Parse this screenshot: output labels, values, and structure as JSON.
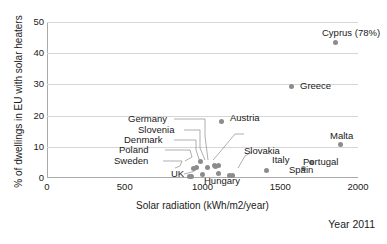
{
  "chart_data": {
    "type": "scatter",
    "title": "",
    "xlabel": "Solar radiation (kWh/m2/year)",
    "ylabel": "% of dwellings in EU with solar heaters",
    "xlim": [
      0,
      2000
    ],
    "ylim": [
      0,
      50
    ],
    "xticks": [
      "0",
      "500",
      "1000",
      "1500",
      "2000"
    ],
    "yticks": [
      "0",
      "10",
      "20",
      "30",
      "40",
      "50"
    ],
    "grid": "horizontal",
    "legend": "none",
    "annotation": "Year 2011",
    "marker_color": "#8c8c8c",
    "points": [
      {
        "name": "Cyprus",
        "label": "Cyprus (78%)",
        "x": 1855,
        "y": 43.5
      },
      {
        "name": "Greece",
        "label": "Greece",
        "x": 1575,
        "y": 29.2
      },
      {
        "name": "Austria",
        "label": "Austria",
        "x": 1125,
        "y": 18.2
      },
      {
        "name": "Malta",
        "label": "Malta",
        "x": 1885,
        "y": 10.8
      },
      {
        "name": "Germany",
        "label": "Germany",
        "x": 1075,
        "y": 4.0
      },
      {
        "name": "Slovenia",
        "label": "Slovenia",
        "x": 1085,
        "y": 3.6
      },
      {
        "name": "France",
        "label": "France",
        "x": 1105,
        "y": 3.9
      },
      {
        "name": "Denmark",
        "label": "Denmark",
        "x": 985,
        "y": 5.3
      },
      {
        "name": "Poland",
        "label": "Poland",
        "x": 960,
        "y": 3.4
      },
      {
        "name": "Sweden",
        "label": "Sweden",
        "x": 945,
        "y": 3.1
      },
      {
        "name": "UK",
        "label": "UK",
        "x": 930,
        "y": 0.6
      },
      {
        "name": "Hungary",
        "label": "Hungary",
        "x": 1175,
        "y": 0.9
      },
      {
        "name": "Slovakia",
        "label": "Slovakia",
        "x": 1195,
        "y": 0.8
      },
      {
        "name": "Italy",
        "label": "Italy",
        "x": 1410,
        "y": 2.4
      },
      {
        "name": "Portugal",
        "label": "Portugal",
        "x": 1700,
        "y": 5.0
      },
      {
        "name": "Spain",
        "label": "Spain",
        "x": 1650,
        "y": 3.2
      },
      {
        "name": "extra1",
        "label": "",
        "x": 1000,
        "y": 1.1
      },
      {
        "name": "extra2",
        "label": "",
        "x": 1105,
        "y": 1.4
      },
      {
        "name": "extra3",
        "label": "",
        "x": 1035,
        "y": 3.3
      },
      {
        "name": "extra4",
        "label": "",
        "x": 915,
        "y": 0.5
      }
    ]
  },
  "axes": {
    "x_title": "Solar radiation (kWh/m2/year)",
    "y_title": "% of dwellings in EU with solar heaters",
    "xticks": [
      "0",
      "500",
      "1000",
      "1500",
      "2000"
    ],
    "yticks": [
      "0",
      "10",
      "20",
      "30",
      "40",
      "50"
    ]
  },
  "labels": {
    "cyprus": "Cyprus (78%)",
    "greece": "Greece",
    "austria": "Austria",
    "malta": "Malta",
    "germany": "Germany",
    "slovenia": "Slovenia",
    "france": "France",
    "denmark": "Denmark",
    "poland": "Poland",
    "sweden": "Sweden",
    "uk": "UK",
    "hungary": "Hungary",
    "slovakia": "Slovakia",
    "italy": "Italy",
    "portugal": "Portugal",
    "spain": "Spain"
  },
  "footer": {
    "year_note": "Year 2011"
  }
}
